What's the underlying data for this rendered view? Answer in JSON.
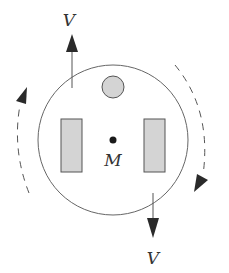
{
  "diagram": {
    "type": "rotating-disk-diagram",
    "labels": {
      "top_velocity": "V",
      "bottom_velocity": "V",
      "center": "M"
    },
    "elements": {
      "disk": {
        "cx": 113,
        "cy": 140,
        "r": 75
      },
      "small_circle": {
        "cx": 113,
        "cy": 87,
        "r": 11
      },
      "left_block": {
        "x": 61,
        "y": 119,
        "w": 21,
        "h": 53
      },
      "right_block": {
        "x": 144,
        "y": 119,
        "w": 21,
        "h": 53
      },
      "center_dot": {
        "cx": 113,
        "cy": 140,
        "r": 3.5
      }
    },
    "colors": {
      "stroke": "#555555",
      "fill_gray": "#d4d4d4",
      "arrow": "#2a2a2a",
      "text": "#333333"
    },
    "rotation": "clockwise"
  }
}
